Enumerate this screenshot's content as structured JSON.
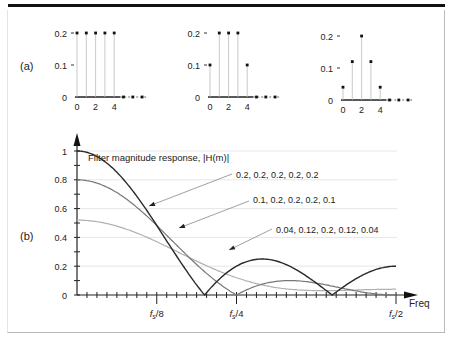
{
  "panel_labels": {
    "a": "(a)",
    "b": "(b)"
  },
  "chart_data": [
    {
      "type": "stem",
      "panel": "a1",
      "x": [
        0,
        1,
        2,
        3,
        4,
        5,
        6,
        7
      ],
      "values": [
        0.2,
        0.2,
        0.2,
        0.2,
        0.2,
        0,
        0,
        0
      ],
      "yticks": [
        "0",
        "0.1",
        "0.2"
      ],
      "xticks": [
        "0",
        "2",
        "4"
      ],
      "ylim": [
        0,
        0.2
      ]
    },
    {
      "type": "stem",
      "panel": "a2",
      "x": [
        0,
        1,
        2,
        3,
        4,
        5,
        6,
        7
      ],
      "values": [
        0.1,
        0.2,
        0.2,
        0.2,
        0.1,
        0,
        0,
        0
      ],
      "yticks": [
        "0",
        "0.1",
        "0.2"
      ],
      "xticks": [
        "0",
        "2",
        "4"
      ],
      "ylim": [
        0,
        0.2
      ]
    },
    {
      "type": "stem",
      "panel": "a3",
      "x": [
        0,
        1,
        2,
        3,
        4,
        5,
        6,
        7
      ],
      "values": [
        0.04,
        0.12,
        0.2,
        0.12,
        0.04,
        0,
        0,
        0
      ],
      "yticks": [
        "0",
        "0.1",
        "0.2"
      ],
      "xticks": [
        "0",
        "2",
        "4"
      ],
      "ylim": [
        0,
        0.2
      ]
    },
    {
      "type": "line",
      "panel": "b",
      "title": "Filter magnitude response, |H(m)|",
      "xlabel": "Freq",
      "ylabel": "",
      "xtick_labels": [
        "fs/8",
        "fs/4",
        "fs/2"
      ],
      "xtick_positions": [
        0.125,
        0.25,
        0.5
      ],
      "yticks": [
        "0",
        "0.2",
        "0.4",
        "0.6",
        "0.8",
        "1"
      ],
      "ylim": [
        0,
        1
      ],
      "xlim": [
        0,
        0.5
      ],
      "grid": true,
      "series": [
        {
          "name": "0.2, 0.2, 0.2, 0.2, 0.2",
          "coeffs": [
            0.2,
            0.2,
            0.2,
            0.2,
            0.2
          ],
          "color": "#2a2a2a"
        },
        {
          "name": "0.1, 0.2, 0.2, 0.2, 0.1",
          "coeffs": [
            0.1,
            0.2,
            0.2,
            0.2,
            0.1
          ],
          "color": "#777777"
        },
        {
          "name": "0.04, 0.12, 0.2, 0.12, 0.04",
          "coeffs": [
            0.04,
            0.12,
            0.2,
            0.12,
            0.04
          ],
          "color": "#b0b0b0"
        }
      ]
    }
  ]
}
